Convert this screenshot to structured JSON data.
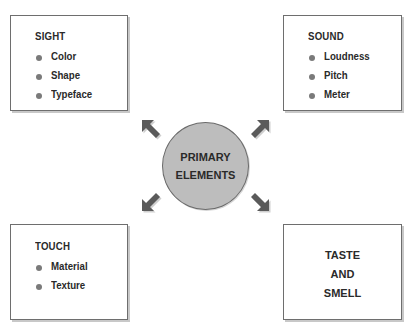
{
  "diagram": {
    "center": {
      "line1": "PRIMARY",
      "line2": "ELEMENTS"
    },
    "boxes": {
      "sight": {
        "title": "SIGHT",
        "items": [
          "Color",
          "Shape",
          "Typeface"
        ]
      },
      "sound": {
        "title": "SOUND",
        "items": [
          "Loudness",
          "Pitch",
          "Meter"
        ]
      },
      "touch": {
        "title": "TOUCH",
        "items": [
          "Material",
          "Texture"
        ]
      },
      "taste_smell": {
        "lines": [
          "TASTE",
          "AND",
          "SMELL"
        ]
      }
    },
    "arrows": [
      "up-left",
      "up-right",
      "down-left",
      "down-right"
    ],
    "colors": {
      "circle_fill": "#bdbdbd",
      "arrow": "#5a5a5a",
      "border": "#6e6e6e",
      "bullet": "#7a7a7a"
    }
  }
}
